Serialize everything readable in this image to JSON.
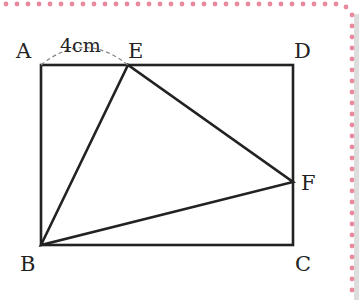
{
  "figure": {
    "shape": "rectangle ABCD with triangle BEF",
    "points": {
      "A": {
        "label": "A",
        "x": 41,
        "y": 65
      },
      "E": {
        "label": "E",
        "x": 128,
        "y": 65
      },
      "D": {
        "label": "D",
        "x": 293,
        "y": 65
      },
      "B": {
        "label": "B",
        "x": 41,
        "y": 245
      },
      "C": {
        "label": "C",
        "x": 293,
        "y": 245
      },
      "F": {
        "label": "F",
        "x": 293,
        "y": 182
      }
    },
    "measurement": {
      "segment": "AE",
      "label": "4cm"
    },
    "colors": {
      "line": "#222222",
      "border_dots": "#e58a9e",
      "shadow": "#d9d9d9"
    }
  }
}
